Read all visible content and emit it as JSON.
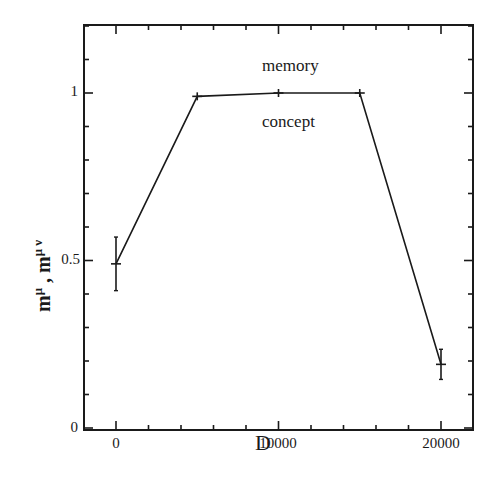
{
  "chart_data": {
    "type": "line",
    "title": "",
    "xlabel": "D",
    "ylabel": "m^μ , m^μν",
    "xlim": [
      -3000,
      23000
    ],
    "ylim": [
      0,
      1.2
    ],
    "x_ticks": [
      0,
      10000,
      20000
    ],
    "x_tick_labels": [
      "0",
      "10000",
      "20000"
    ],
    "y_ticks": [
      0,
      0.5,
      1
    ],
    "y_tick_labels": [
      "0",
      "0.5",
      "1"
    ],
    "grid": false,
    "legend": null,
    "annotations": [
      {
        "text": "memory",
        "x": 10000,
        "y": 1.07
      },
      {
        "text": "concept",
        "x": 10000,
        "y": 0.92
      }
    ],
    "series": [
      {
        "name": "m",
        "x": [
          0,
          5000,
          10000,
          15000,
          20000
        ],
        "y": [
          0.49,
          0.99,
          1.0,
          1.0,
          0.19
        ],
        "yerr": [
          0.08,
          0.0,
          0.0,
          0.0,
          0.045
        ]
      }
    ]
  },
  "labels": {
    "xlabel": "D",
    "ylabel_main": "m",
    "ylabel_sup1": "μ",
    "ylabel_sep": " ,  m",
    "ylabel_sup2": "μ ν",
    "memory": "memory",
    "concept": "concept",
    "yticks": [
      "0",
      "0.5",
      "1"
    ],
    "xticks": [
      "0",
      "10000",
      "20000"
    ]
  }
}
